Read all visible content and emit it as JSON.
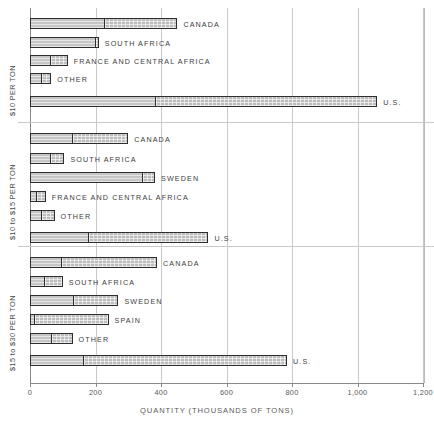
{
  "chart_data": {
    "type": "bar",
    "orientation": "horizontal",
    "title": "",
    "xlabel": "QUANTITY (THOUSANDS OF TONS)",
    "ylabel": "",
    "xlim": [
      0,
      1200
    ],
    "xticks": [
      0,
      200,
      400,
      600,
      800,
      1000,
      1200
    ],
    "xticklabels": [
      "0",
      "200",
      "400",
      "600",
      "800",
      "1,000",
      "1,200"
    ],
    "grid": true,
    "grid_axis": "x",
    "stacked": true,
    "segment_names": [
      "reserves",
      "additional resources"
    ],
    "panels": [
      {
        "label": "$10 PER TON",
        "categories": [
          "CANADA",
          "SOUTH AFRICA",
          "FRANCE AND CENTRAL AFRICA",
          "OTHER",
          "U.S."
        ],
        "segment_a": [
          225,
          200,
          60,
          35,
          380
        ],
        "segment_b": [
          225,
          10,
          55,
          30,
          680
        ],
        "totals": [
          450,
          210,
          115,
          65,
          1060
        ]
      },
      {
        "label": "$10 to $15 PER TON",
        "categories": [
          "CANADA",
          "SOUTH AFRICA",
          "SWEDEN",
          "FRANCE AND CENTRAL AFRICA",
          "OTHER",
          "U.S."
        ],
        "segment_a": [
          128,
          60,
          345,
          18,
          33,
          175
        ],
        "segment_b": [
          172,
          45,
          37,
          30,
          42,
          370
        ],
        "totals": [
          300,
          105,
          382,
          48,
          75,
          545
        ]
      },
      {
        "label": "$15 to $30 PER TON",
        "categories": [
          "CANADA",
          "SOUTH AFRICA",
          "SWEDEN",
          "SPAIN",
          "OTHER",
          "U.S."
        ],
        "segment_a": [
          92,
          42,
          130,
          8,
          65,
          160
        ],
        "segment_b": [
          296,
          58,
          140,
          232,
          65,
          625
        ],
        "totals": [
          388,
          100,
          270,
          240,
          130,
          785
        ]
      }
    ]
  },
  "axis": {
    "title": "QUANTITY (THOUSANDS OF TONS)",
    "ticks": [
      "0",
      "200",
      "400",
      "600",
      "800",
      "1,000",
      "1,200"
    ]
  },
  "panels": [
    {
      "label": "$10 PER TON",
      "bars": [
        {
          "name": "CANADA",
          "total": 450,
          "a": 225,
          "b": 225
        },
        {
          "name": "SOUTH AFRICA",
          "total": 210,
          "a": 200,
          "b": 10
        },
        {
          "name": "FRANCE AND CENTRAL AFRICA",
          "total": 115,
          "a": 60,
          "b": 55
        },
        {
          "name": "OTHER",
          "total": 65,
          "a": 35,
          "b": 30
        },
        {
          "name": "U.S.",
          "total": 1060,
          "a": 380,
          "b": 680
        }
      ]
    },
    {
      "label": "$10 to $15 PER TON",
      "bars": [
        {
          "name": "CANADA",
          "total": 300,
          "a": 128,
          "b": 172
        },
        {
          "name": "SOUTH AFRICA",
          "total": 105,
          "a": 60,
          "b": 45
        },
        {
          "name": "SWEDEN",
          "total": 382,
          "a": 345,
          "b": 37
        },
        {
          "name": "FRANCE AND CENTRAL AFRICA",
          "total": 48,
          "a": 18,
          "b": 30
        },
        {
          "name": "OTHER",
          "total": 75,
          "a": 33,
          "b": 42
        },
        {
          "name": "U.S.",
          "total": 545,
          "a": 175,
          "b": 370
        }
      ]
    },
    {
      "label": "$15 to $30 PER TON",
      "bars": [
        {
          "name": "CANADA",
          "total": 388,
          "a": 92,
          "b": 296
        },
        {
          "name": "SOUTH AFRICA",
          "total": 100,
          "a": 42,
          "b": 58
        },
        {
          "name": "SWEDEN",
          "total": 270,
          "a": 130,
          "b": 140
        },
        {
          "name": "SPAIN",
          "total": 240,
          "a": 8,
          "b": 232
        },
        {
          "name": "OTHER",
          "total": 130,
          "a": 65,
          "b": 65
        },
        {
          "name": "U.S.",
          "total": 785,
          "a": 160,
          "b": 625
        }
      ]
    }
  ],
  "colors": {
    "segment_a": "#c6c6c6",
    "segment_b": "#bdbdbd",
    "bar_outline": "#2e2e2e",
    "gridline": "#c9c9c9",
    "axis": "#8a8a8a",
    "text": "#3d3d3d"
  }
}
